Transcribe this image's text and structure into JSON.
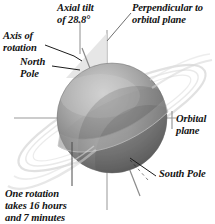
{
  "diagram": {
    "labels": {
      "axis_of_rotation": "Axis of\nrotation",
      "axial_tilt": "Axial tilt\nof 28.8°",
      "perpendicular": "Perpendicular to\norbital plane",
      "north_pole": "North\nPole",
      "orbital_plane": "Orbital\nplane",
      "south_pole": "South Pole",
      "one_rotation": "One rotation\ntakes 16 hours\nand 7 minutes"
    },
    "values": {
      "axial_tilt_degrees": "28.8",
      "rotation_hours": "16",
      "rotation_minutes": "7"
    },
    "colors": {
      "background": "#ffffff",
      "text": "#121212",
      "leader_line": "#1a1a1a",
      "construction_line": "#9a9a9a",
      "planet_light": "#c6c6c6",
      "planet_mid": "#9b9b9b",
      "planet_dark": "#5d5d5d",
      "ring_faint": "#d8d8d8",
      "tilt_wedge": "#dedede"
    },
    "geometry": {
      "planet_center_x": 112,
      "planet_center_y": 118,
      "planet_radius": 55,
      "perpendicular_axis_x": 107,
      "orbital_plane_y": 118
    }
  }
}
